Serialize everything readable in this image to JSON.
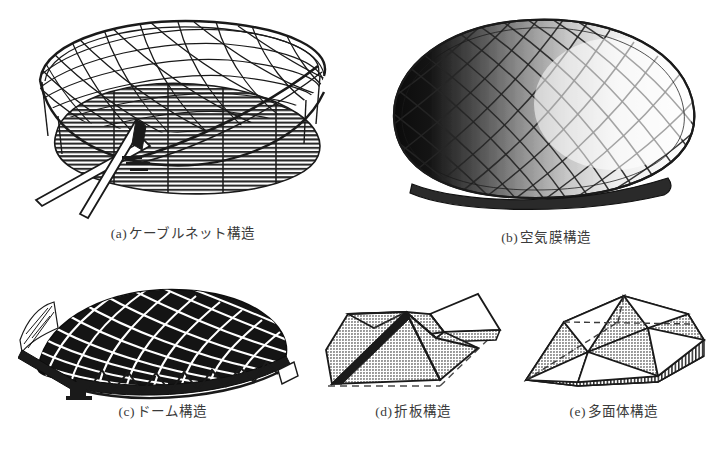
{
  "plate": {
    "background_color": "#ffffff",
    "ink_color": "#1a1a1a",
    "caption_color": "#3a3a3a",
    "gray_fill_color": "#b9b9b9",
    "width": 726,
    "height": 452
  },
  "figures": [
    {
      "id": "a",
      "label": "(a)",
      "caption": "ケーブルネット構造",
      "caption_full": "(a) ケーブルネット構造",
      "art_name": "cable-net-structure-drawing",
      "description": "saddle-shaped cable net roof on elliptical plan with crossing masts and hatched ground plane"
    },
    {
      "id": "b",
      "label": "(b)",
      "caption": "空気膜構造",
      "caption_full": "(b) 空気膜構造",
      "art_name": "air-membrane-structure-drawing",
      "description": "rounded pneumatic membrane dome with diagonal cable grid and dark left-side shading"
    },
    {
      "id": "c",
      "label": "(c)",
      "caption": "ドーム構造",
      "caption_full": "(c) ドーム構造",
      "art_name": "dome-structure-drawing",
      "description": "dark lattice shell dome supported on a perimeter truss edge beam"
    },
    {
      "id": "d",
      "label": "(d)",
      "caption": "折板構造",
      "caption_full": "(d) 折板構造",
      "art_name": "folded-plate-structure-drawing",
      "description": "folded plate roof of gray triangular facets with dashed ground outline"
    },
    {
      "id": "e",
      "label": "(e)",
      "caption": "多面体構造",
      "caption_full": "(e) 多面体構造",
      "art_name": "polyhedron-structure-drawing",
      "description": "faceted polyhedral shell with gray and white triangles over vertically hatched base"
    }
  ]
}
